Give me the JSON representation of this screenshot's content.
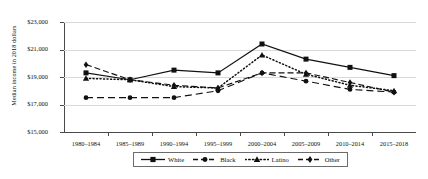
{
  "chart_data": {
    "type": "line",
    "title": "",
    "xlabel": "",
    "ylabel": "Median income in 2018 dollars",
    "categories": [
      "1980–1984",
      "1985–1989",
      "1990–1994",
      "1995–1999",
      "2000–2004",
      "2005–2009",
      "2010–2014",
      "2015–2018"
    ],
    "ylim": [
      15000,
      23000
    ],
    "ytick_values": [
      15000,
      17000,
      19000,
      21000,
      23000
    ],
    "ytick_labels": [
      "$15,000",
      "$17,000",
      "$19,000",
      "$21,000",
      "$23,000"
    ],
    "grid": true,
    "legend_position": "bottom-center",
    "series": [
      {
        "name": "White",
        "marker": "square",
        "line": "solid",
        "values": [
          19300,
          18800,
          19500,
          19300,
          21400,
          20300,
          19700,
          19100
        ]
      },
      {
        "name": "Black",
        "marker": "circle",
        "line": "long-dash",
        "values": [
          17500,
          17500,
          17500,
          18000,
          19300,
          18700,
          18100,
          17900
        ]
      },
      {
        "name": "Latino",
        "marker": "triangle",
        "line": "dotted",
        "values": [
          18900,
          18800,
          18300,
          18200,
          20600,
          19200,
          18400,
          18000
        ]
      },
      {
        "name": "Other",
        "marker": "diamond",
        "line": "dash-dot",
        "values": [
          19900,
          18800,
          18400,
          18200,
          19300,
          19300,
          18600,
          17900
        ]
      }
    ]
  },
  "legend": {
    "items": [
      {
        "label": "White"
      },
      {
        "label": "Black"
      },
      {
        "label": "Latino"
      },
      {
        "label": "Other"
      }
    ]
  }
}
